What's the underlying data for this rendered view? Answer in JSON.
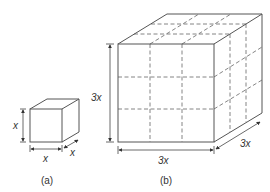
{
  "diagram": {
    "small_cube": {
      "caption": "(a)",
      "height_label": "x",
      "width_label": "x",
      "depth_label": "x"
    },
    "large_cube": {
      "caption": "(b)",
      "height_label": "3x",
      "width_label": "3x",
      "depth_label": "3x",
      "grid_divisions": 3
    },
    "colors": {
      "edge": "#555555",
      "dashed": "#666666",
      "background": "#ffffff"
    }
  }
}
